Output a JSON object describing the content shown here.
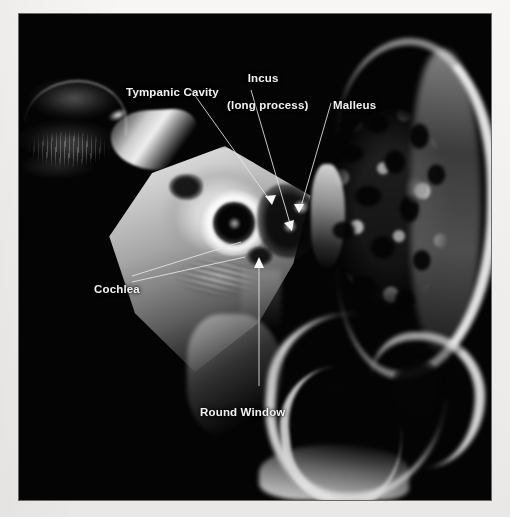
{
  "figure": {
    "modality": "ct-temporal-bone",
    "panel_background": "#040404",
    "page_background": "#f2f1ef",
    "annotation_color": "#f2f2f2"
  },
  "annotations": [
    {
      "id": "tympanic-cavity",
      "label": "Tympanic Cavity",
      "lines": [
        "Tympanic Cavity"
      ],
      "text_x": 87,
      "text_y": 58,
      "align": "left",
      "leader": {
        "x1": 172,
        "y1": 76,
        "x2": 252,
        "y2": 188
      },
      "arrow": {
        "x": 253,
        "y": 191,
        "angle": 215
      }
    },
    {
      "id": "incus-long-process",
      "label": "Incus (long process)",
      "lines": [
        "Incus",
        "(long process)"
      ],
      "text_x": 188,
      "text_y": 44,
      "align": "center",
      "leader": {
        "x1": 232,
        "y1": 76,
        "x2": 272,
        "y2": 213
      },
      "arrow": {
        "x": 273,
        "y": 216,
        "angle": 195
      }
    },
    {
      "id": "malleus",
      "label": "Malleus",
      "lines": [
        "Malleus"
      ],
      "text_x": 294,
      "text_y": 71,
      "align": "left",
      "leader": {
        "x1": 312,
        "y1": 89,
        "x2": 281,
        "y2": 196
      },
      "arrow": {
        "x": 280,
        "y": 199,
        "angle": 163
      }
    },
    {
      "id": "cochlea",
      "label": "Cochlea",
      "lines": [
        "Cochlea"
      ],
      "text_x": 55,
      "text_y": 255,
      "align": "left",
      "leader": {
        "x1": 113,
        "y1": 262,
        "x2": 222,
        "y2": 228
      },
      "leader2": {
        "x1": 113,
        "y1": 268,
        "x2": 226,
        "y2": 243
      },
      "arrow": null
    },
    {
      "id": "round-window",
      "label": "Round Window",
      "lines": [
        "Round Window"
      ],
      "text_x": 161,
      "text_y": 378,
      "align": "left",
      "leader": {
        "x1": 240,
        "y1": 372,
        "x2": 240,
        "y2": 250
      },
      "arrow": {
        "x": 240,
        "y": 244,
        "angle": 0
      }
    }
  ]
}
